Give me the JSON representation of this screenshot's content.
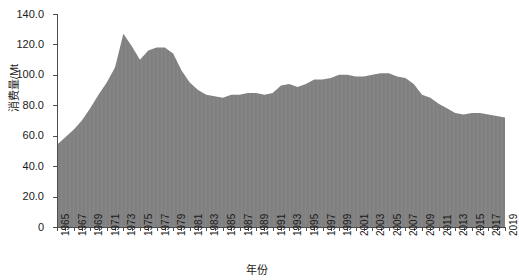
{
  "chart_data": {
    "type": "area",
    "title": "",
    "xlabel": "年份",
    "ylabel": "消费量/Mt",
    "xlim": [
      1965,
      2019
    ],
    "ylim": [
      0,
      140
    ],
    "grid": false,
    "legend": null,
    "fill_color": "#808080",
    "axis_color": "#4d4d4d",
    "ytick_labels": [
      "0",
      "20.0",
      "40.0",
      "60.0",
      "80.0",
      "100.0",
      "120.0",
      "140.0"
    ],
    "ytick_values": [
      0,
      20,
      40,
      60,
      80,
      100,
      120,
      140
    ],
    "xtick_labels": [
      "1965",
      "1967",
      "1969",
      "1971",
      "1973",
      "1975",
      "1977",
      "1979",
      "1981",
      "1983",
      "1985",
      "1987",
      "1989",
      "1991",
      "1993",
      "1995",
      "1997",
      "1999",
      "2001",
      "2003",
      "2005",
      "2007",
      "2009",
      "2011",
      "2013",
      "2015",
      "2017",
      "2019"
    ],
    "xtick_values": [
      1965,
      1967,
      1969,
      1971,
      1973,
      1975,
      1977,
      1979,
      1981,
      1983,
      1985,
      1987,
      1989,
      1991,
      1993,
      1995,
      1997,
      1999,
      2001,
      2003,
      2005,
      2007,
      2009,
      2011,
      2013,
      2015,
      2017,
      2019
    ],
    "x": [
      1965,
      1966,
      1967,
      1968,
      1969,
      1970,
      1971,
      1972,
      1973,
      1974,
      1975,
      1976,
      1977,
      1978,
      1979,
      1980,
      1981,
      1982,
      1983,
      1984,
      1985,
      1986,
      1987,
      1988,
      1989,
      1990,
      1991,
      1992,
      1993,
      1994,
      1995,
      1996,
      1997,
      1998,
      1999,
      2000,
      2001,
      2002,
      2003,
      2004,
      2005,
      2006,
      2007,
      2008,
      2009,
      2010,
      2011,
      2012,
      2013,
      2014,
      2015,
      2016,
      2017,
      2018,
      2019
    ],
    "values": [
      54.0,
      59.0,
      64.0,
      70.0,
      78.0,
      87.0,
      95.0,
      105.0,
      127.0,
      119.0,
      110.0,
      116.0,
      118.0,
      118.0,
      114.0,
      103.0,
      95.0,
      90.0,
      87.0,
      86.0,
      85.0,
      87.0,
      87.0,
      88.0,
      88.0,
      87.0,
      88.0,
      93.0,
      94.0,
      92.0,
      94.0,
      97.0,
      97.0,
      98.0,
      100.0,
      100.0,
      99.0,
      99.0,
      100.0,
      101.0,
      101.0,
      99.0,
      98.0,
      94.0,
      87.0,
      85.0,
      81.0,
      78.0,
      75.0,
      74.0,
      75.0,
      75.0,
      74.0,
      73.0,
      72.0
    ]
  }
}
